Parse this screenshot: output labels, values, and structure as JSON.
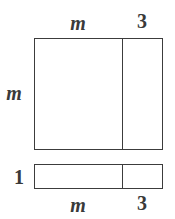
{
  "diagram": {
    "type": "area-model",
    "stroke_color": "#3c3c3c",
    "label_color": "#3a3a3a",
    "large_rectangle": {
      "width_parts": [
        "m",
        "3"
      ],
      "height": "m",
      "labels": {
        "top_left": "m",
        "top_right": "3",
        "left": "m"
      }
    },
    "small_rectangle": {
      "width_parts": [
        "m",
        "3"
      ],
      "height": "1",
      "labels": {
        "left": "1",
        "bottom_left": "m",
        "bottom_right": "3"
      }
    }
  }
}
